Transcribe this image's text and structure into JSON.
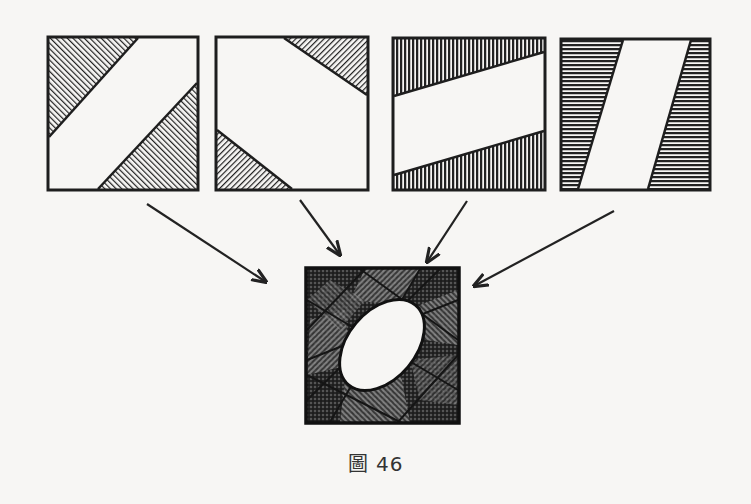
{
  "figure": {
    "caption": "圖 46",
    "ink_color": "#1e1e1e",
    "paper_color": "#f7f6f4"
  },
  "panels": [
    {
      "id": "panel-1",
      "hatch": "diagonal-45",
      "description": "white diagonal band from top-right to bottom-left; hatched triangles top-left and bottom-right"
    },
    {
      "id": "panel-2",
      "hatch": "diagonal-neg",
      "description": "white center; hatched triangles top-right and bottom-left"
    },
    {
      "id": "panel-3",
      "hatch": "vertical",
      "description": "white slanted horizontal band; hatched top and bottom regions"
    },
    {
      "id": "panel-4",
      "hatch": "horizontal",
      "description": "white slanted vertical parallelogram; hatched left and right regions"
    }
  ],
  "result": {
    "id": "combined-panel",
    "description": "overlay of the four panels: cross-hatched square with white ellipse in center"
  },
  "arrows": [
    {
      "from": "panel-1",
      "to": "combined-panel"
    },
    {
      "from": "panel-2",
      "to": "combined-panel"
    },
    {
      "from": "panel-3",
      "to": "combined-panel"
    },
    {
      "from": "panel-4",
      "to": "combined-panel"
    }
  ]
}
